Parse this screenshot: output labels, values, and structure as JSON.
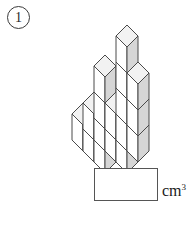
{
  "problem": {
    "number": "1"
  },
  "answer": {
    "value": "",
    "placeholder": "",
    "unit_text": "cm",
    "unit_exponent": "3"
  },
  "figure": {
    "type": "isometric-cube-stack",
    "total_cubes": 17,
    "colors": {
      "top_face": "#f2f2f2",
      "left_face": "#ffffff",
      "right_face": "#d6d6d6",
      "outline": "#4a4a4a"
    },
    "geometry": {
      "cube_unit_width": 22,
      "cube_unit_depth_y": 11,
      "cube_unit_height": 26,
      "origin_x": 72,
      "origin_y": 140
    },
    "cubes": [
      {
        "x": 0,
        "y": 0,
        "z": 0
      },
      {
        "x": 1,
        "y": 0,
        "z": 0
      },
      {
        "x": 2,
        "y": 0,
        "z": 0
      },
      {
        "x": 0,
        "y": 1,
        "z": 0
      },
      {
        "x": 1,
        "y": 1,
        "z": 0
      },
      {
        "x": 2,
        "y": 1,
        "z": 0
      },
      {
        "x": 3,
        "y": 1,
        "z": 0
      },
      {
        "x": 0,
        "y": 2,
        "z": 0
      },
      {
        "x": 2,
        "y": 2,
        "z": 0
      },
      {
        "x": 3,
        "y": 2,
        "z": 0
      },
      {
        "x": 0,
        "y": 2,
        "z": 1
      },
      {
        "x": 2,
        "y": 2,
        "z": 1
      },
      {
        "x": 2,
        "y": 2,
        "z": 2
      },
      {
        "x": 2,
        "y": 2,
        "z": 3
      },
      {
        "x": 3,
        "y": 2,
        "z": 1
      },
      {
        "x": 3,
        "y": 2,
        "z": 2
      },
      {
        "x": 1,
        "y": 2,
        "z": 0
      }
    ]
  }
}
